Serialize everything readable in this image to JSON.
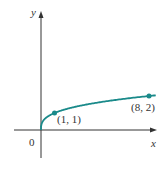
{
  "chart_data": {
    "type": "line",
    "title": "",
    "xlabel": "x",
    "ylabel": "y",
    "function": "y = x^(1/3)",
    "series": [
      {
        "name": "curve",
        "x": [
          0,
          0.125,
          0.5,
          1,
          2,
          3,
          4,
          5,
          6,
          7,
          8,
          8.5
        ],
        "values": [
          0,
          0.5,
          0.794,
          1,
          1.26,
          1.442,
          1.587,
          1.71,
          1.817,
          1.913,
          2,
          2.041
        ]
      }
    ],
    "points": [
      {
        "x": 1,
        "y": 1,
        "label": "(1, 1)"
      },
      {
        "x": 8,
        "y": 2,
        "label": "(8, 2)"
      }
    ],
    "origin_label": "0",
    "grid": false,
    "color": "#1a8a8a"
  },
  "labels": {
    "y_axis": "y",
    "x_axis": "x",
    "origin": "0",
    "point1": "(1, 1)",
    "point2": "(8, 2)"
  }
}
